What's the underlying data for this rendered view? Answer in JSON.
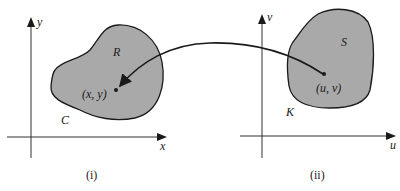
{
  "panels": [
    {
      "caption": "(i)",
      "x_axis_label": "x",
      "y_axis_label": "y",
      "region_label": "R",
      "boundary_label": "C",
      "point_label": "(x, y)"
    },
    {
      "caption": "(ii)",
      "x_axis_label": "u",
      "y_axis_label": "v",
      "region_label": "S",
      "boundary_label": "K",
      "point_label": "(u, v)"
    }
  ],
  "colors": {
    "region_fill": "#a9a9a9",
    "stroke": "#1a1a1a",
    "axis": "#333333"
  }
}
